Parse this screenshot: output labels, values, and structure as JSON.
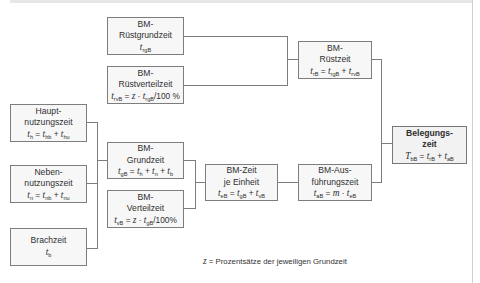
{
  "diagram": {
    "boxes": {
      "ruestgrundzeit": {
        "line1": "BM-",
        "line2": "Rüstgrundzeit",
        "formula": {
          "lhs": "t",
          "lhs_sub": "rgB"
        }
      },
      "ruestverteilzeit": {
        "line1": "BM-",
        "line2": "Rüstverteilzeit",
        "formula": {
          "lhs": "t",
          "lhs_sub": "rvB",
          "eq": " = ",
          "z": "z",
          "dot": " · ",
          "t": "t",
          "t_sub": "rgB",
          "tail": "/100 %"
        }
      },
      "ruestzeit": {
        "line1": "BM-",
        "line2": "Rüstzeit",
        "formula": {
          "lhs": "t",
          "lhs_sub": "rB",
          "eq": " = ",
          "a": "t",
          "a_sub": "rgB",
          "plus": " + ",
          "b": "t",
          "b_sub": "rvB"
        }
      },
      "hauptnutzungszeit": {
        "line1": "Haupt-",
        "line2": "nutzungszeit",
        "formula": {
          "lhs": "t",
          "lhs_sub": "h",
          "eq": " = ",
          "a": "t",
          "a_sub": "hb",
          "plus": " + ",
          "b": "t",
          "b_sub": "hu"
        }
      },
      "nebennutzungszeit": {
        "line1": "Neben-",
        "line2": "nutzungszeit",
        "formula": {
          "lhs": "t",
          "lhs_sub": "n",
          "eq": " = ",
          "a": "t",
          "a_sub": "nb",
          "plus": " + ",
          "b": "t",
          "b_sub": "nu"
        }
      },
      "brachzeit": {
        "line1": "Brachzeit",
        "formula": {
          "lhs": "t",
          "lhs_sub": "b"
        }
      },
      "grundzeit": {
        "line1": "BM-",
        "line2": "Grundzeit",
        "formula": {
          "lhs": "t",
          "lhs_sub": "gB",
          "eq": " = ",
          "a": "t",
          "a_sub": "h",
          "plus": " + ",
          "b": "t",
          "b_sub": "n",
          "plus2": " + ",
          "c": "t",
          "c_sub": "b"
        }
      },
      "verteilzeit": {
        "line1": "BM-",
        "line2": "Verteilzeit",
        "formula": {
          "lhs": "t",
          "lhs_sub": "vB",
          "eq": " = ",
          "z": "z",
          "dot": " · ",
          "t": "t",
          "t_sub": "gB",
          "tail": "/100%"
        }
      },
      "zeit_je_einheit": {
        "line1": "BM-Zeit",
        "line2": "je Einheit",
        "formula": {
          "lhs": "t",
          "lhs_sub": "eB",
          "eq": " = ",
          "a": "t",
          "a_sub": "gB",
          "plus": " + ",
          "b": "t",
          "b_sub": "vB"
        }
      },
      "ausfuehrungszeit": {
        "line1": "BM-Aus-",
        "line2": "führungszeit",
        "formula": {
          "lhs": "t",
          "lhs_sub": "aB",
          "eq": " = ",
          "m": "m",
          "dot": " · ",
          "t": "t",
          "t_sub": "eB"
        }
      },
      "belegungszeit": {
        "line1": "Belegungs-",
        "line2": "zeit",
        "formula": {
          "lhs": "T",
          "lhs_sub": "bB",
          "eq": " = ",
          "a": "t",
          "a_sub": "rB",
          "plus": " + ",
          "b": "t",
          "b_sub": "aB"
        }
      }
    },
    "footnote": {
      "var": "z",
      "text": " = Prozentsätze der jeweiligen Grundzeit"
    },
    "colors": {
      "border": "#7d7d7d",
      "box_fill": "#f7f7f7",
      "result_fill": "#f2f2f2",
      "text": "#2f2f2f"
    }
  }
}
